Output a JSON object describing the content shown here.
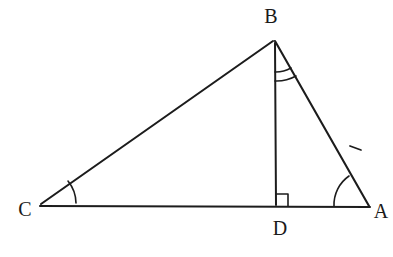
{
  "figure": {
    "type": "geometry-diagram",
    "background_color": "#ffffff",
    "stroke_color": "#1c1c1c",
    "label_color": "#1a1a1a",
    "points": [
      {
        "id": "B",
        "label": "B",
        "x": 274,
        "y": 40,
        "label_x": 271,
        "label_y": 17
      },
      {
        "id": "C",
        "label": "C",
        "x": 41,
        "y": 205,
        "label_x": 25,
        "label_y": 210
      },
      {
        "id": "A",
        "label": "A",
        "x": 369,
        "y": 207,
        "label_x": 380,
        "label_y": 212
      },
      {
        "id": "D",
        "label": "D",
        "x": 276,
        "y": 206,
        "label_x": 279,
        "label_y": 229
      }
    ],
    "segments": [
      {
        "id": "CB",
        "from": "C",
        "to": "B",
        "name": "side-cb"
      },
      {
        "id": "BA",
        "from": "B",
        "to": "A",
        "name": "side-ba"
      },
      {
        "id": "CA",
        "from": "C",
        "to": "A",
        "name": "side-ca"
      },
      {
        "id": "BD",
        "from": "B",
        "to": "D",
        "name": "altitude-bd"
      }
    ],
    "angle_marks": [
      {
        "id": "angle-C",
        "at": "C",
        "arcs": 1,
        "label": ""
      },
      {
        "id": "angle-A",
        "at": "A",
        "arcs": 1,
        "label": ""
      },
      {
        "id": "angle-DBA",
        "at": "B",
        "arcs": 2,
        "label": ""
      }
    ],
    "right_angle": {
      "at": "D",
      "between": [
        "BD",
        "DA"
      ],
      "size": 11
    },
    "tick_marks": [
      {
        "on": "BA",
        "count": 1,
        "x": 355,
        "y": 148
      }
    ]
  }
}
